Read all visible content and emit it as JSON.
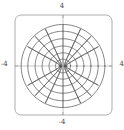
{
  "figure": {
    "title": "",
    "kind": "elliptic-coordinate-grid",
    "background_color": "#ffffff",
    "frame": {
      "color": "#9a9a9a",
      "line_width": 0.8,
      "corner_radius": 6,
      "x": 15,
      "y": 15,
      "width": 97,
      "height": 100
    },
    "axes_lines": {
      "color": "#b0b0b0",
      "line_width": 0.7,
      "x_axis_y": 66,
      "y_axis_x": 63
    },
    "curves": {
      "color": "#555555",
      "line_width": 0.75
    }
  },
  "labels": {
    "top": "4",
    "bottom": "-4",
    "left": "-4",
    "right": "4"
  },
  "chart_data": {
    "type": "line",
    "title": "",
    "xlabel": "",
    "ylabel": "",
    "xlim": [
      -4,
      4
    ],
    "ylim": [
      -4,
      4
    ],
    "xticks": [
      -4,
      4
    ],
    "yticks": [
      -4,
      4
    ],
    "xticklabels": [
      "-4",
      "4"
    ],
    "yticklabels": [
      "-4",
      "4"
    ],
    "grid": false,
    "legend": null,
    "foci": [
      {
        "x": -0.28,
        "y": 0.0
      },
      {
        "x": 0.28,
        "y": 0.0
      }
    ],
    "series": [
      {
        "name": "ellipse-1",
        "family": "ellipse",
        "param_u": 0.3,
        "semi_major": 0.62,
        "semi_minor": 0.55
      },
      {
        "name": "ellipse-2",
        "family": "ellipse",
        "param_u": 0.55,
        "semi_major": 1.15,
        "semi_minor": 1.05
      },
      {
        "name": "ellipse-3",
        "family": "ellipse",
        "param_u": 0.8,
        "semi_major": 1.72,
        "semi_minor": 1.6
      },
      {
        "name": "ellipse-4",
        "family": "ellipse",
        "param_u": 1.05,
        "semi_major": 2.3,
        "semi_minor": 2.18
      },
      {
        "name": "ellipse-5",
        "family": "ellipse",
        "param_u": 1.3,
        "semi_major": 2.9,
        "semi_minor": 2.78
      },
      {
        "name": "ellipse-6",
        "family": "ellipse",
        "param_u": 1.55,
        "semi_major": 3.45,
        "semi_minor": 3.32
      },
      {
        "name": "hyperbola-L3",
        "family": "hyperbola",
        "param_v_deg": -62
      },
      {
        "name": "hyperbola-L2",
        "family": "hyperbola",
        "param_v_deg": -44
      },
      {
        "name": "hyperbola-L1",
        "family": "hyperbola",
        "param_v_deg": -26
      },
      {
        "name": "hyperbola-C0",
        "family": "hyperbola",
        "param_v_deg": 0
      },
      {
        "name": "hyperbola-R1",
        "family": "hyperbola",
        "param_v_deg": 26
      },
      {
        "name": "hyperbola-R2",
        "family": "hyperbola",
        "param_v_deg": 44
      },
      {
        "name": "hyperbola-R3",
        "family": "hyperbola",
        "param_v_deg": 62
      }
    ]
  }
}
